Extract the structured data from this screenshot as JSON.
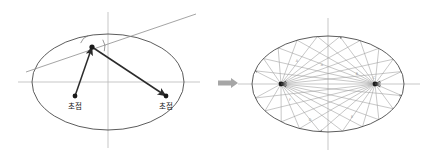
{
  "figure": {
    "background_color": "#ffffff",
    "width": 432,
    "height": 157
  },
  "palette": {
    "ellipse_stroke": "#4a4a4a",
    "axis_stroke": "#b9b9b9",
    "tangent_stroke": "#8d8d8d",
    "ray_stroke": "#2b2b2b",
    "reflect_ray_stroke": "#9a9a9a",
    "focus_dot": "#1a1a1a",
    "label_color": "#1a1a1a",
    "arrow_fill": "#a6a6a6"
  },
  "left_panel": {
    "name": "single-reflection-panel",
    "ellipse": {
      "cx": 108,
      "cy": 82,
      "rx": 76,
      "ry": 48
    },
    "axes": {
      "horizontal": {
        "x1": 18,
        "y1": 82,
        "x2": 200,
        "y2": 82
      },
      "vertical": {
        "x1": 108,
        "y1": 12,
        "x2": 108,
        "y2": 148
      }
    },
    "tangent_line": {
      "x1": 26,
      "y1": 72,
      "x2": 196,
      "y2": 14
    },
    "tangent_point": {
      "x": 92,
      "y": 47
    },
    "focus_left": {
      "x": 75,
      "y": 96,
      "label": "초점",
      "label_x": 75,
      "label_y": 109
    },
    "focus_right": {
      "x": 166,
      "y": 96,
      "label": "초점",
      "label_x": 166,
      "label_y": 109
    },
    "incoming_ray": {
      "from_x": 75,
      "from_y": 96,
      "to_x": 92,
      "to_y": 47
    },
    "outgoing_ray": {
      "from_x": 92,
      "from_y": 47,
      "to_x": 166,
      "to_y": 96
    },
    "angle_arcs": [
      {
        "cx": 92,
        "cy": 47,
        "r": 12,
        "start_deg": 199,
        "end_deg": 252
      },
      {
        "cx": 92,
        "cy": 47,
        "r": 13,
        "start_deg": 326,
        "end_deg": 19
      }
    ]
  },
  "transition": {
    "name": "transition-arrow",
    "glyph": "rightwards-block-arrow",
    "x": 218,
    "y": 83,
    "color": "#a6a6a6"
  },
  "right_panel": {
    "name": "multi-reflection-panel",
    "ellipse": {
      "cx": 328,
      "cy": 84,
      "rx": 76,
      "ry": 48
    },
    "axes": {
      "horizontal": {
        "x1": 238,
        "y1": 84,
        "x2": 420,
        "y2": 84
      },
      "vertical": {
        "x1": 328,
        "y1": 18,
        "x2": 328,
        "y2": 150
      }
    },
    "focus_left": {
      "x": 281,
      "y": 84
    },
    "focus_right": {
      "x": 375,
      "y": 84
    },
    "bounce_angles_deg": [
      14,
      31,
      48,
      63,
      79,
      96,
      112,
      128,
      146,
      163,
      196,
      212,
      229,
      246,
      262,
      279,
      295,
      312,
      329,
      345
    ],
    "ray_tag_labels": [
      "A",
      "A",
      "B",
      "C",
      "D",
      "E",
      "F"
    ],
    "ray_tags": [
      {
        "text": "A",
        "x": 297,
        "y": 62
      },
      {
        "text": "A",
        "x": 322,
        "y": 66
      },
      {
        "text": "B",
        "x": 357,
        "y": 75
      },
      {
        "text": "C",
        "x": 374,
        "y": 79
      },
      {
        "text": "D",
        "x": 310,
        "y": 121
      },
      {
        "text": "E",
        "x": 352,
        "y": 118
      },
      {
        "text": "F",
        "x": 290,
        "y": 101
      }
    ]
  }
}
